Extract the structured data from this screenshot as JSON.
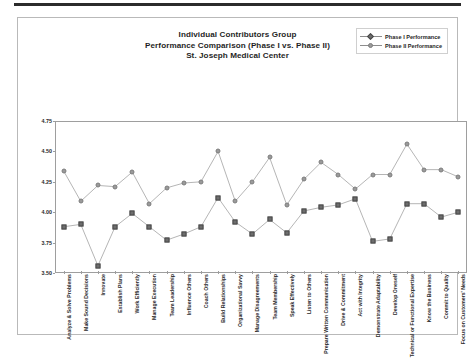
{
  "chart_data": {
    "type": "line",
    "title": "Individual Contributors Group",
    "subtitle": "Performance Comparison (Phase I vs. Phase II)",
    "subtitle2": "St. Joseph Medical Center",
    "title_lines": [
      "Individual Contributors Group",
      "Performance Comparison (Phase I vs. Phase II)",
      "St. Joseph Medical Center"
    ],
    "xlabel": "",
    "ylabel": "",
    "ylim": [
      3.5,
      4.75
    ],
    "yticks": [
      "4.75",
      "4.50",
      "4.25",
      "4.00",
      "3.75",
      "3.50"
    ],
    "ytick_values": [
      4.75,
      4.5,
      4.25,
      4.0,
      3.75,
      3.5
    ],
    "grid": false,
    "legend_position": "top-right",
    "categories": [
      "Analyze & Solve Problems",
      "Make Sound Decisions",
      "Innovate",
      "Establish Plans",
      "Work Efficiently",
      "Manage Execution",
      "Team Leadership",
      "Influence Others",
      "Coach Others",
      "Build Relationships",
      "Organizational Savvy",
      "Manage Disagreements",
      "Team Membership",
      "Speak Effectively",
      "Listen to Others",
      "Prepare Written Communication",
      "Drive & Commitment",
      "Act with Integrity",
      "Demonstrate Adaptability",
      "Develop Oneself",
      "Technical or Functional Expertise",
      "Know the Business",
      "Commit to Quality",
      "Focus on Customers' Needs"
    ],
    "series": [
      {
        "name": "Phase I Performance",
        "marker": "diamond",
        "color": "#6d6d6d",
        "values": [
          3.88,
          3.9,
          3.56,
          3.88,
          3.99,
          3.88,
          3.77,
          3.82,
          3.88,
          4.12,
          3.92,
          3.82,
          3.94,
          3.83,
          4.01,
          4.04,
          4.06,
          4.11,
          3.76,
          3.78,
          4.07,
          4.07,
          3.96,
          4.0
        ]
      },
      {
        "name": "Phase II Performance",
        "marker": "circle",
        "color": "#9a9a9a",
        "values": [
          4.34,
          4.09,
          4.22,
          4.21,
          4.33,
          4.07,
          4.2,
          4.24,
          4.25,
          4.5,
          4.09,
          4.25,
          4.45,
          4.06,
          4.27,
          4.41,
          4.31,
          4.19,
          4.31,
          4.31,
          4.56,
          4.35,
          4.35,
          4.29
        ]
      }
    ]
  },
  "legend": {
    "items": [
      {
        "label": "Phase I Performance",
        "marker": "diamond"
      },
      {
        "label": "Phase II Performance",
        "marker": "circle"
      }
    ]
  }
}
